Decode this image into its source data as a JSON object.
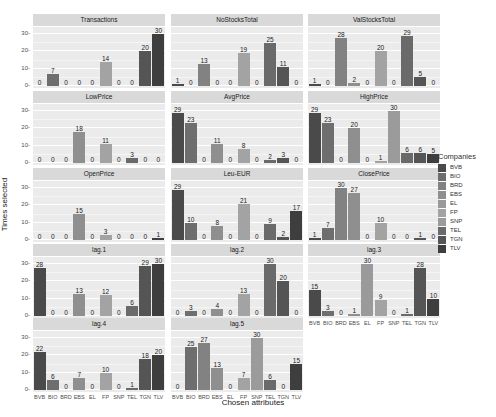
{
  "chart_data": {
    "type": "bar",
    "layout": "facet_wrap",
    "xlabel": "Chosen attributes",
    "ylabel": "Times selected",
    "ylim": [
      0,
      33
    ],
    "yticks": [
      0,
      10,
      20,
      30
    ],
    "categories": [
      "BVB",
      "BIO",
      "BRD",
      "EBS",
      "EL",
      "FP",
      "SNP",
      "TEL",
      "TGN",
      "TLV"
    ],
    "legend": {
      "title": "Companies",
      "position": "right",
      "entries": [
        "BVB",
        "BIO",
        "BRD",
        "EBS",
        "EL",
        "FP",
        "SNP",
        "TEL",
        "TGN",
        "TLV"
      ]
    },
    "colors": {
      "BVB": "#4a4a4a",
      "BIO": "#6e6e6e",
      "BRD": "#828282",
      "EBS": "#8f8f8f",
      "EL": "#9a9a9a",
      "FP": "#a3a3a3",
      "SNP": "#9b9b9b",
      "TEL": "#6a6a6a",
      "TGN": "#555555",
      "TLV": "#3e3e3e"
    },
    "facets": [
      {
        "name": "Transactions",
        "values": [
          0,
          7,
          0,
          0,
          0,
          14,
          0,
          0,
          20,
          30
        ]
      },
      {
        "name": "NoStocksTotal",
        "values": [
          1,
          0,
          13,
          0,
          0,
          19,
          0,
          25,
          11,
          0
        ]
      },
      {
        "name": "ValStocksTotal",
        "values": [
          1,
          0,
          28,
          2,
          0,
          20,
          0,
          29,
          5,
          0
        ]
      },
      {
        "name": "LowPrice",
        "values": [
          0,
          0,
          0,
          18,
          0,
          11,
          0,
          3,
          0,
          0
        ]
      },
      {
        "name": "AvgPrice",
        "values": [
          29,
          23,
          0,
          11,
          0,
          8,
          0,
          2,
          3,
          0
        ]
      },
      {
        "name": "HighPrice",
        "values": [
          29,
          23,
          0,
          20,
          0,
          1,
          30,
          6,
          6,
          5
        ]
      },
      {
        "name": "OpenPrice",
        "values": [
          0,
          0,
          0,
          15,
          0,
          3,
          0,
          0,
          0,
          1
        ]
      },
      {
        "name": "Leu-EUR",
        "values": [
          29,
          10,
          0,
          8,
          0,
          21,
          0,
          9,
          2,
          17
        ]
      },
      {
        "name": "ClosePrice",
        "values": [
          1,
          7,
          30,
          27,
          0,
          10,
          0,
          0,
          1,
          0
        ]
      },
      {
        "name": "lag.1",
        "values": [
          28,
          0,
          0,
          13,
          0,
          12,
          0,
          6,
          29,
          30
        ]
      },
      {
        "name": "lag.2",
        "values": [
          0,
          3,
          0,
          4,
          0,
          13,
          0,
          30,
          20,
          0
        ]
      },
      {
        "name": "lag.3",
        "values": [
          15,
          3,
          0,
          1,
          30,
          9,
          0,
          1,
          28,
          10
        ]
      },
      {
        "name": "lag.4",
        "values": [
          22,
          6,
          0,
          7,
          0,
          10,
          0,
          1,
          18,
          20
        ]
      },
      {
        "name": "lag.5",
        "values": [
          0,
          25,
          27,
          13,
          0,
          7,
          30,
          6,
          0,
          15
        ]
      }
    ]
  }
}
